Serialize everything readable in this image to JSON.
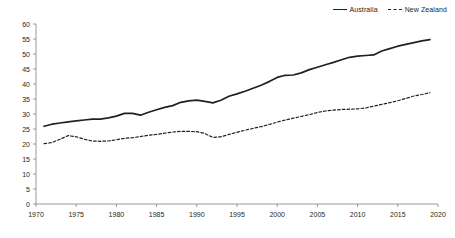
{
  "chart_data": {
    "type": "line",
    "title": "",
    "xlabel": "",
    "ylabel": "",
    "xlim": [
      1970,
      2020
    ],
    "ylim": [
      0,
      60
    ],
    "ytick_step": 5,
    "xtick_step": 5,
    "grid": false,
    "legend_position": "top-right",
    "xticks": [
      "1970",
      "1975",
      "1980",
      "1985",
      "1990",
      "1995",
      "2000",
      "2005",
      "2010",
      "2015",
      "2020"
    ],
    "yticks": [
      "0",
      "5",
      "10",
      "15",
      "20",
      "25",
      "30",
      "35",
      "40",
      "45",
      "50",
      "55",
      "60"
    ],
    "x": [
      1971,
      1972,
      1973,
      1974,
      1975,
      1976,
      1977,
      1978,
      1979,
      1980,
      1981,
      1982,
      1983,
      1984,
      1985,
      1986,
      1987,
      1988,
      1989,
      1990,
      1991,
      1992,
      1993,
      1994,
      1995,
      1996,
      1997,
      1998,
      1999,
      2000,
      2001,
      2002,
      2003,
      2004,
      2005,
      2006,
      2007,
      2008,
      2009,
      2010,
      2011,
      2012,
      2013,
      2014,
      2015,
      2016,
      2017,
      2018,
      2019
    ],
    "series": [
      {
        "name": "Australia",
        "style": "solid",
        "color": "#231f20",
        "values": [
          25.9,
          26.6,
          27.0,
          27.4,
          27.7,
          28.0,
          28.3,
          28.3,
          28.7,
          29.3,
          30.2,
          30.2,
          29.6,
          30.6,
          31.4,
          32.2,
          32.8,
          33.9,
          34.4,
          34.6,
          34.2,
          33.7,
          34.6,
          35.9,
          36.7,
          37.6,
          38.6,
          39.6,
          40.8,
          42.2,
          42.9,
          43.0,
          43.7,
          44.8,
          45.6,
          46.4,
          47.2,
          48.1,
          48.9,
          49.3,
          49.5,
          49.7,
          51.0,
          51.8,
          52.6,
          53.2,
          53.8,
          54.4,
          54.8
        ]
      },
      {
        "name": "New Zealand",
        "style": "dashed",
        "color": "#231f20",
        "values": [
          20.1,
          20.5,
          21.6,
          22.8,
          22.4,
          21.6,
          21.0,
          20.9,
          21.0,
          21.4,
          21.9,
          22.1,
          22.5,
          22.9,
          23.2,
          23.6,
          24.0,
          24.2,
          24.2,
          24.1,
          23.5,
          22.2,
          22.4,
          23.2,
          23.9,
          24.6,
          25.2,
          25.8,
          26.5,
          27.3,
          28.0,
          28.6,
          29.2,
          29.8,
          30.5,
          31.0,
          31.3,
          31.5,
          31.6,
          31.7,
          32.0,
          32.6,
          33.2,
          33.8,
          34.4,
          35.2,
          36.0,
          36.5,
          37.1
        ]
      }
    ],
    "legend": [
      {
        "label": "Australia",
        "style": "solid"
      },
      {
        "label": "New Zealand",
        "style": "dashed"
      }
    ]
  }
}
